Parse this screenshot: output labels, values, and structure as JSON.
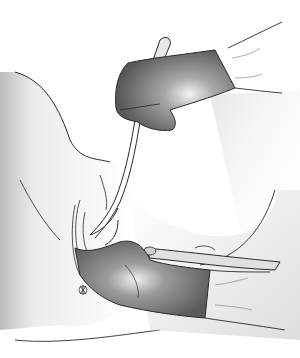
{
  "image": {
    "description": "Grayscale medical illustration: two gloved hands, one holding a catheter/instrument from above, one inserting a speculum-like instrument from below right",
    "width": 300,
    "height": 358,
    "colors": {
      "background": "#ffffff",
      "outline": "#2a2a2a",
      "glove_dark": "#6e6e6e",
      "glove_light": "#d8d8d8",
      "skin_shade": "#cfcfcf",
      "light_beam": "#e6e6e6"
    }
  }
}
